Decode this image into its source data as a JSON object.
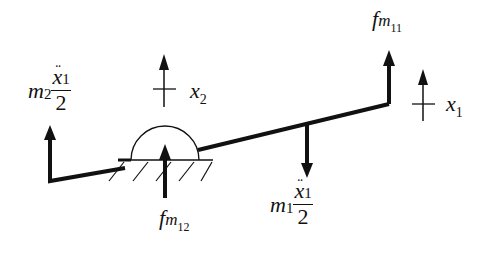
{
  "diagram": {
    "title": "",
    "labels": {
      "f_m11": {
        "base": "f",
        "sub_var": "m",
        "sub_idx": "11"
      },
      "f_m12": {
        "base": "f",
        "sub_var": "m",
        "sub_idx": "12"
      },
      "x1": {
        "base": "x",
        "sub": "1"
      },
      "x2": {
        "base": "x",
        "sub": "2"
      },
      "m2_term": {
        "mass": "m",
        "mass_sub": "2",
        "numerator": "x",
        "numerator_sub": "1",
        "denominator": "2",
        "accent": "¨"
      },
      "m1_term": {
        "mass": "m",
        "mass_sub": "1",
        "numerator": "x",
        "numerator_sub": "1",
        "denominator": "2",
        "accent": "¨"
      }
    },
    "elements": [
      {
        "type": "beam",
        "description": "tilted rigid beam pivoted on semicircular support"
      },
      {
        "type": "pivot",
        "description": "semicircular hinge on hatched ground"
      },
      {
        "type": "force-arrow",
        "label": "f_m11",
        "direction": "up"
      },
      {
        "type": "force-arrow",
        "label": "f_m12",
        "direction": "up"
      },
      {
        "type": "force-arrow",
        "label": "m1_term",
        "direction": "down"
      },
      {
        "type": "force-arrow",
        "label": "m2_term",
        "direction": "up"
      },
      {
        "type": "displacement-arrow",
        "label": "x1",
        "direction": "up"
      },
      {
        "type": "displacement-arrow",
        "label": "x2",
        "direction": "up"
      }
    ],
    "colors": {
      "stroke": "#111111",
      "background": "#ffffff"
    }
  }
}
